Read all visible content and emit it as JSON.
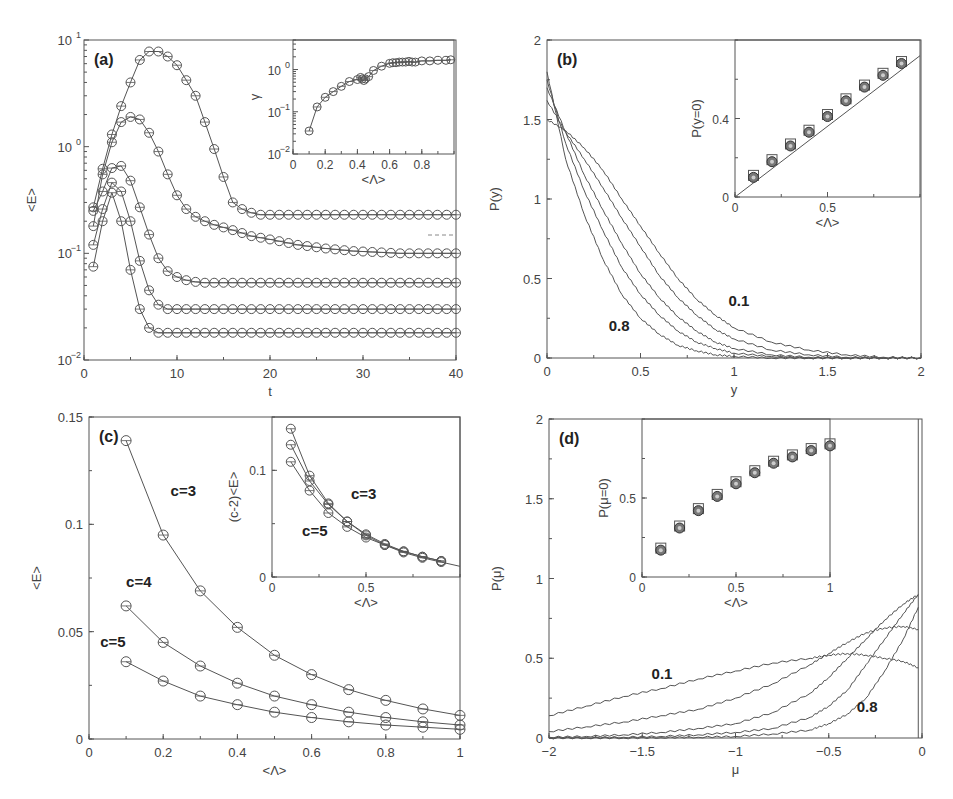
{
  "figure": {
    "panels": [
      "(a)",
      "(b)",
      "(c)",
      "(d)"
    ]
  },
  "chart_data": [
    {
      "id": "a",
      "type": "line",
      "panel_label": "(a)",
      "xlabel": "t",
      "ylabel": "<E>",
      "xlim": [
        0,
        40
      ],
      "yscale": "log",
      "ylim": [
        0.01,
        10
      ],
      "xticks": [
        "0",
        "10",
        "20",
        "30",
        "40"
      ],
      "yticks": [
        "10^-2",
        "10^-1",
        "10^0",
        "10^1"
      ],
      "marker": "open-circle",
      "x": [
        1,
        2,
        3,
        4,
        5,
        6,
        7,
        8,
        9,
        10,
        11,
        12,
        13,
        14,
        15,
        16,
        17,
        18,
        19,
        20,
        21,
        22,
        23,
        24,
        25,
        26,
        27,
        28,
        29,
        30,
        31,
        32,
        33,
        34,
        35,
        36,
        37,
        38,
        39,
        40
      ],
      "series": [
        {
          "name": "curve1",
          "values": [
            0.27,
            0.62,
            1.3,
            2.4,
            4.0,
            6.5,
            7.8,
            7.8,
            7.0,
            5.8,
            4.2,
            3.0,
            1.7,
            0.95,
            0.52,
            0.3,
            0.26,
            0.24,
            0.23,
            0.23,
            0.23,
            0.23,
            0.23,
            0.23,
            0.23,
            0.23,
            0.23,
            0.23,
            0.23,
            0.23,
            0.23,
            0.23,
            0.23,
            0.23,
            0.23,
            0.23,
            0.23,
            0.23,
            0.23,
            0.23
          ]
        },
        {
          "name": "curve2",
          "values": [
            0.18,
            0.55,
            1.1,
            1.7,
            1.9,
            1.8,
            1.35,
            0.9,
            0.55,
            0.35,
            0.26,
            0.22,
            0.2,
            0.185,
            0.175,
            0.165,
            0.155,
            0.145,
            0.14,
            0.135,
            0.13,
            0.125,
            0.12,
            0.117,
            0.114,
            0.111,
            0.109,
            0.107,
            0.105,
            0.104,
            0.103,
            0.102,
            0.101,
            0.1,
            0.1,
            0.1,
            0.1,
            0.1,
            0.1,
            0.1
          ]
        },
        {
          "name": "curve3",
          "values": [
            0.25,
            0.38,
            0.63,
            0.66,
            0.48,
            0.27,
            0.15,
            0.09,
            0.068,
            0.06,
            0.056,
            0.054,
            0.053,
            0.053,
            0.053,
            0.053,
            0.053,
            0.053,
            0.053,
            0.053,
            0.053,
            0.053,
            0.053,
            0.053,
            0.053,
            0.053,
            0.053,
            0.053,
            0.053,
            0.053,
            0.053,
            0.053,
            0.053,
            0.053,
            0.053,
            0.053,
            0.053,
            0.053,
            0.053,
            0.053
          ]
        },
        {
          "name": "curve4",
          "values": [
            0.12,
            0.26,
            0.46,
            0.38,
            0.2,
            0.085,
            0.045,
            0.033,
            0.03,
            0.03,
            0.03,
            0.03,
            0.03,
            0.03,
            0.03,
            0.03,
            0.03,
            0.03,
            0.03,
            0.03,
            0.03,
            0.03,
            0.03,
            0.03,
            0.03,
            0.03,
            0.03,
            0.03,
            0.03,
            0.03,
            0.03,
            0.03,
            0.03,
            0.03,
            0.03,
            0.03,
            0.03,
            0.03,
            0.03,
            0.03
          ]
        },
        {
          "name": "curve5",
          "values": [
            0.075,
            0.2,
            0.37,
            0.2,
            0.07,
            0.03,
            0.02,
            0.018,
            0.018,
            0.018,
            0.018,
            0.018,
            0.018,
            0.018,
            0.018,
            0.018,
            0.018,
            0.018,
            0.018,
            0.018,
            0.018,
            0.018,
            0.018,
            0.018,
            0.018,
            0.018,
            0.018,
            0.018,
            0.018,
            0.018,
            0.018,
            0.018,
            0.018,
            0.018,
            0.018,
            0.018,
            0.018,
            0.018,
            0.018,
            0.018
          ]
        }
      ],
      "inset": {
        "type": "line",
        "xlabel": "<Λ>",
        "ylabel": "γ",
        "xlim": [
          0,
          1
        ],
        "yscale": "log",
        "ylim": [
          0.01,
          5
        ],
        "xticks": [
          "0",
          "0.2",
          "0.4",
          "0.6",
          "0.8"
        ],
        "yticks": [
          "10^-2",
          "10^-1",
          "10^0"
        ],
        "x": [
          0.1,
          0.15,
          0.2,
          0.25,
          0.3,
          0.35,
          0.4,
          0.42,
          0.43,
          0.44,
          0.45,
          0.47,
          0.5,
          0.55,
          0.6,
          0.62,
          0.64,
          0.66,
          0.68,
          0.7,
          0.72,
          0.74,
          0.76,
          0.8,
          0.85,
          0.9,
          0.95,
          0.98
        ],
        "values": [
          0.035,
          0.13,
          0.22,
          0.3,
          0.4,
          0.52,
          0.58,
          0.65,
          0.6,
          0.55,
          0.6,
          0.68,
          0.95,
          1.2,
          1.4,
          1.45,
          1.45,
          1.5,
          1.5,
          1.5,
          1.55,
          1.5,
          1.5,
          1.6,
          1.6,
          1.65,
          1.65,
          1.7
        ]
      }
    },
    {
      "id": "b",
      "type": "line",
      "panel_label": "(b)",
      "xlabel": "y",
      "ylabel": "P(y)",
      "xlim": [
        0,
        2
      ],
      "ylim": [
        0,
        2
      ],
      "xticks": [
        "0",
        "0.5",
        "1",
        "1.5",
        "2"
      ],
      "yticks": [
        "0",
        "0.5",
        "1",
        "1.5",
        "2"
      ],
      "annotations": [
        {
          "text": "0.1",
          "x": 0.97,
          "y": 0.33
        },
        {
          "text": "0.8",
          "x": 0.33,
          "y": 0.17
        }
      ],
      "x": [
        0,
        0.1,
        0.2,
        0.3,
        0.4,
        0.5,
        0.6,
        0.7,
        0.8,
        0.9,
        1.0,
        1.2,
        1.4,
        1.6,
        1.8,
        2.0
      ],
      "series": [
        {
          "name": "0.1",
          "values": [
            1.5,
            1.43,
            1.32,
            1.18,
            1.0,
            0.83,
            0.66,
            0.5,
            0.37,
            0.27,
            0.19,
            0.1,
            0.05,
            0.02,
            0.005,
            0
          ]
        },
        {
          "name": "0.3",
          "values": [
            1.62,
            1.42,
            1.25,
            1.07,
            0.88,
            0.7,
            0.52,
            0.38,
            0.27,
            0.18,
            0.12,
            0.05,
            0.02,
            0.005,
            0,
            0
          ]
        },
        {
          "name": "0.5",
          "values": [
            1.7,
            1.42,
            1.15,
            0.93,
            0.72,
            0.53,
            0.38,
            0.26,
            0.17,
            0.1,
            0.06,
            0.02,
            0.005,
            0,
            0,
            0
          ]
        },
        {
          "name": "0.65",
          "values": [
            1.75,
            1.35,
            1.05,
            0.8,
            0.57,
            0.4,
            0.27,
            0.17,
            0.1,
            0.06,
            0.03,
            0.01,
            0,
            0,
            0,
            0
          ]
        },
        {
          "name": "0.8",
          "values": [
            1.8,
            1.25,
            0.9,
            0.62,
            0.4,
            0.25,
            0.15,
            0.08,
            0.045,
            0.02,
            0.01,
            0,
            0,
            0,
            0,
            0
          ]
        }
      ],
      "inset": {
        "type": "scatter",
        "xlabel": "<Λ>",
        "ylabel": "P(y=0)",
        "xlim": [
          0,
          1
        ],
        "ylim": [
          0,
          0.8
        ],
        "xticks": [
          "0",
          "0.5"
        ],
        "yticks": [
          "0",
          "0.4"
        ],
        "x": [
          0.1,
          0.2,
          0.3,
          0.4,
          0.5,
          0.6,
          0.7,
          0.8,
          0.9
        ],
        "values": [
          0.1,
          0.18,
          0.26,
          0.33,
          0.41,
          0.49,
          0.56,
          0.62,
          0.68
        ],
        "fit_line": {
          "x": [
            0,
            1
          ],
          "y": [
            0,
            0.72
          ]
        }
      }
    },
    {
      "id": "c",
      "type": "line",
      "panel_label": "(c)",
      "xlabel": "<Λ>",
      "ylabel": "<E>",
      "xlim": [
        0,
        1
      ],
      "ylim": [
        0,
        0.15
      ],
      "xticks": [
        "0",
        "0.2",
        "0.4",
        "0.6",
        "0.8",
        "1"
      ],
      "yticks": [
        "0",
        "0.05",
        "0.1",
        "0.15"
      ],
      "x": [
        0.1,
        0.2,
        0.3,
        0.4,
        0.5,
        0.6,
        0.7,
        0.8,
        0.9,
        1.0
      ],
      "series": [
        {
          "name": "c=3",
          "values": [
            0.139,
            0.095,
            0.069,
            0.052,
            0.039,
            0.03,
            0.023,
            0.018,
            0.014,
            0.011
          ]
        },
        {
          "name": "c=4",
          "values": [
            0.062,
            0.045,
            0.034,
            0.026,
            0.02,
            0.016,
            0.0125,
            0.01,
            0.008,
            0.0065
          ]
        },
        {
          "name": "c=5",
          "values": [
            0.036,
            0.027,
            0.02,
            0.016,
            0.0125,
            0.01,
            0.008,
            0.0065,
            0.0055,
            0.0045
          ]
        }
      ],
      "annotations": [
        {
          "text": "c=3",
          "x": 0.22,
          "y": 0.113
        },
        {
          "text": "c=4",
          "x": 0.1,
          "y": 0.071
        },
        {
          "text": "c=5",
          "x": 0.03,
          "y": 0.043
        }
      ],
      "inset": {
        "type": "line",
        "xlabel": "<Λ>",
        "ylabel": "(c-2)<E>",
        "xlim": [
          0,
          1
        ],
        "ylim": [
          0,
          0.15
        ],
        "xticks": [
          "0",
          "0.5"
        ],
        "yticks": [
          "0",
          "0.1"
        ],
        "x": [
          0.1,
          0.2,
          0.3,
          0.4,
          0.5,
          0.6,
          0.7,
          0.8,
          0.9
        ],
        "series": [
          {
            "name": "c=3",
            "values": [
              0.139,
              0.095,
              0.069,
              0.052,
              0.039,
              0.03,
              0.023,
              0.018,
              0.014
            ]
          },
          {
            "name": "c=4",
            "values": [
              0.124,
              0.09,
              0.068,
              0.052,
              0.04,
              0.031,
              0.024,
              0.019,
              0.015
            ]
          },
          {
            "name": "c=5",
            "values": [
              0.108,
              0.081,
              0.06,
              0.047,
              0.037,
              0.03,
              0.024,
              0.019,
              0.015
            ]
          }
        ],
        "annotations": [
          {
            "text": "c=3",
            "x": 0.42,
            "y": 0.073
          },
          {
            "text": "c=5",
            "x": 0.16,
            "y": 0.038
          }
        ]
      }
    },
    {
      "id": "d",
      "type": "line",
      "panel_label": "(d)",
      "xlabel": "μ",
      "ylabel": "P(μ)",
      "xlim": [
        -2,
        0
      ],
      "ylim": [
        0,
        2
      ],
      "xticks": [
        "-2",
        "-1.5",
        "-1",
        "-0.5",
        "0"
      ],
      "yticks": [
        "0",
        "0.5",
        "1",
        "1.5",
        "2"
      ],
      "annotations": [
        {
          "text": "0.1",
          "x": -1.45,
          "y": 0.37
        },
        {
          "text": "0.8",
          "x": -0.35,
          "y": 0.16
        }
      ],
      "x": [
        -2,
        -1.8,
        -1.6,
        -1.4,
        -1.2,
        -1.0,
        -0.8,
        -0.6,
        -0.5,
        -0.4,
        -0.3,
        -0.2,
        -0.1,
        -0.02
      ],
      "series": [
        {
          "name": "0.1",
          "values": [
            0.14,
            0.2,
            0.26,
            0.31,
            0.37,
            0.42,
            0.47,
            0.5,
            0.52,
            0.53,
            0.52,
            0.5,
            0.48,
            0.44
          ]
        },
        {
          "name": "0.3",
          "values": [
            0.04,
            0.07,
            0.1,
            0.14,
            0.18,
            0.25,
            0.34,
            0.46,
            0.53,
            0.6,
            0.66,
            0.69,
            0.7,
            0.68
          ]
        },
        {
          "name": "0.5",
          "values": [
            0.005,
            0.01,
            0.02,
            0.035,
            0.06,
            0.09,
            0.16,
            0.28,
            0.38,
            0.5,
            0.62,
            0.74,
            0.84,
            0.9
          ]
        },
        {
          "name": "0.65",
          "values": [
            0,
            0.002,
            0.005,
            0.01,
            0.02,
            0.035,
            0.06,
            0.13,
            0.2,
            0.3,
            0.46,
            0.62,
            0.78,
            0.9
          ]
        },
        {
          "name": "0.8",
          "values": [
            0,
            0,
            0,
            0.002,
            0.005,
            0.01,
            0.025,
            0.05,
            0.09,
            0.15,
            0.25,
            0.42,
            0.62,
            0.82
          ]
        }
      ],
      "inset": {
        "type": "scatter",
        "xlabel": "<Λ>",
        "ylabel": "P(μ=0)",
        "xlim": [
          0,
          1
        ],
        "ylim": [
          0,
          1
        ],
        "xticks": [
          "0",
          "0.5",
          "1"
        ],
        "yticks": [
          "0",
          "0.5"
        ],
        "x": [
          0.1,
          0.2,
          0.3,
          0.4,
          0.5,
          0.6,
          0.7,
          0.8,
          0.9,
          1.0
        ],
        "values": [
          0.17,
          0.31,
          0.42,
          0.51,
          0.59,
          0.66,
          0.72,
          0.76,
          0.8,
          0.83
        ]
      }
    }
  ]
}
